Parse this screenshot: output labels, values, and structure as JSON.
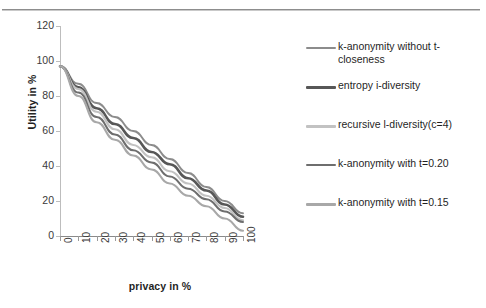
{
  "chart_data": {
    "type": "line",
    "title": "",
    "xlabel": "privacy in %",
    "ylabel": "Utility in %",
    "xlim": [
      0,
      100
    ],
    "ylim": [
      0,
      120
    ],
    "ytick_values": [
      0,
      20,
      40,
      60,
      80,
      100,
      120
    ],
    "xtick_values": [
      0,
      10,
      20,
      30,
      40,
      50,
      60,
      70,
      80,
      90,
      100
    ],
    "grid": false,
    "legend_position": "right",
    "x": [
      0,
      10,
      20,
      30,
      40,
      50,
      60,
      70,
      80,
      90,
      100
    ],
    "series": [
      {
        "name": "k-anonymity without t-closeness",
        "color": "#8c8c8c",
        "width": 1.9,
        "values": [
          97,
          87,
          76,
          68,
          60,
          52,
          44,
          36,
          28,
          20,
          13
        ]
      },
      {
        "name": "entropy i-diversity",
        "color": "#575757",
        "width": 2.6,
        "values": [
          97,
          85,
          73,
          64,
          56,
          48,
          41,
          33,
          26,
          18,
          11
        ]
      },
      {
        "name": "recursive l-diversity(c=4)",
        "color": "#c2c2c2",
        "width": 2.2,
        "values": [
          97,
          84,
          71,
          61,
          52,
          45,
          37,
          30,
          23,
          16,
          9
        ]
      },
      {
        "name": "k-anonymity with t=0.20",
        "color": "#6e6e6e",
        "width": 2.0,
        "values": [
          97,
          82,
          68,
          58,
          49,
          42,
          34,
          27,
          21,
          14,
          8
        ]
      },
      {
        "name": "k-anonymity with t=0.15",
        "color": "#a8a8a8",
        "width": 2.1,
        "values": [
          97,
          80,
          65,
          55,
          46,
          38,
          30,
          23,
          17,
          10,
          3
        ]
      }
    ]
  },
  "axes": {
    "y_title": "Utility in %",
    "x_title": "privacy in %",
    "y_ticks": [
      "0",
      "20",
      "40",
      "60",
      "80",
      "100",
      "120"
    ],
    "x_ticks": [
      "0",
      "10",
      "20",
      "30",
      "40",
      "50",
      "60",
      "70",
      "80",
      "90",
      "100"
    ]
  },
  "legend": {
    "items": [
      {
        "label": "k-anonymity without t-closeness",
        "color": "#8c8c8c",
        "thickness": "2px"
      },
      {
        "label": "entropy i-diversity",
        "color": "#575757",
        "thickness": "3px"
      },
      {
        "label": "recursive l-diversity(c=4)",
        "color": "#c2c2c2",
        "thickness": "3px"
      },
      {
        "label": "k-anonymity with t=0.20",
        "color": "#6e6e6e",
        "thickness": "2px"
      },
      {
        "label": "k-anonymity with t=0.15",
        "color": "#a8a8a8",
        "thickness": "3px"
      }
    ]
  }
}
